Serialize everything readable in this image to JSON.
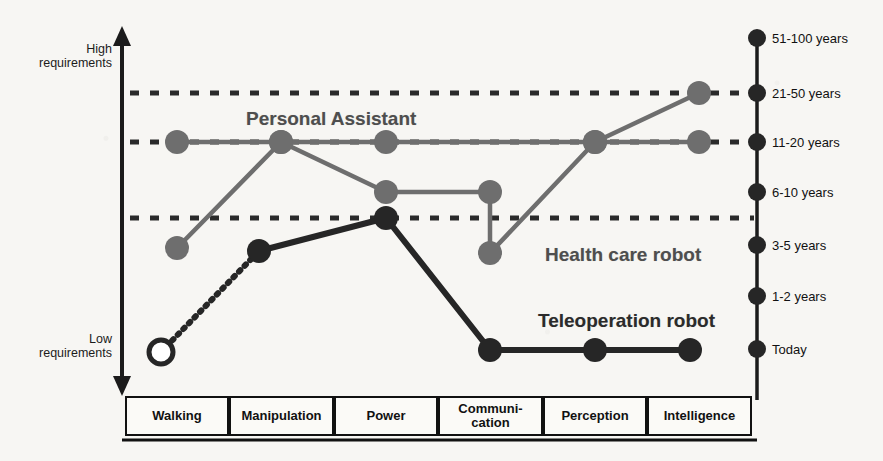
{
  "axis": {
    "left_top_label": "High\nrequirements",
    "left_bottom_label": "Low\nrequirements",
    "right_ticks": [
      {
        "label": "51-100 years",
        "y": 38
      },
      {
        "label": "21-50 years",
        "y": 93
      },
      {
        "label": "11-20 years",
        "y": 142
      },
      {
        "label": "6-10 years",
        "y": 192
      },
      {
        "label": "3-5 years",
        "y": 245
      },
      {
        "label": "1-2 years",
        "y": 296
      },
      {
        "label": "Today",
        "y": 349
      }
    ]
  },
  "categories": [
    {
      "label": "Walking",
      "x": 125,
      "w": 104
    },
    {
      "label": "Manipulation",
      "x": 229,
      "w": 105
    },
    {
      "label": "Power",
      "x": 334,
      "w": 104
    },
    {
      "label": "Communi-\ncation",
      "x": 438,
      "w": 105
    },
    {
      "label": "Perception",
      "x": 543,
      "w": 104
    },
    {
      "label": "Intelligence",
      "x": 647,
      "w": 105
    }
  ],
  "series_labels": {
    "personal_assistant": "Personal Assistant",
    "health_care_robot": "Health care robot",
    "teleoperation_robot": "Teleoperation robot"
  },
  "colors": {
    "ink": "#1b1b1b",
    "series_gray": "#6e6e6e",
    "series_dark": "#262626",
    "gridline": "#2a2a2a",
    "panel_bg": "#f7f6f3"
  },
  "gridlines": [
    93,
    142,
    218
  ],
  "chart_data": {
    "type": "line",
    "xlabel": "",
    "ylabel": "Requirements (low to high)",
    "categories": [
      "Walking",
      "Manipulation",
      "Power",
      "Communication",
      "Perception",
      "Intelligence"
    ],
    "y_axis_right_ticks": [
      "Today",
      "1-2 years",
      "3-5 years",
      "6-10 years",
      "11-20 years",
      "21-50 years",
      "51-100 years"
    ],
    "y_axis_left_range": [
      "Low requirements",
      "High requirements"
    ],
    "grid": true,
    "legend": "inline-annotations",
    "series": [
      {
        "name": "Personal Assistant",
        "color": "#6e6e6e",
        "marker": "filled-circle",
        "values": [
          "11-20 years",
          "11-20 years",
          "11-20 years",
          null,
          "11-20 years",
          "21-50 years"
        ],
        "points": [
          {
            "x": 177,
            "y": 142,
            "category": "Walking",
            "value": "11-20 years",
            "filled": true
          },
          {
            "x": 281,
            "y": 142,
            "category": "Manipulation",
            "value": "11-20 years",
            "filled": true
          },
          {
            "x": 386,
            "y": 142,
            "category": "Power",
            "value": "11-20 years",
            "filled": true
          },
          {
            "x": 595,
            "y": 142,
            "category": "Perception",
            "value": "11-20 years",
            "filled": true
          },
          {
            "x": 699,
            "y": 93,
            "category": "Intelligence",
            "value": "21-50 years",
            "filled": true
          }
        ]
      },
      {
        "name": "Health care robot",
        "color": "#6e6e6e",
        "marker": "filled-circle",
        "values": [
          "3-5 years",
          "11-20 years",
          "6-10 years",
          "3-5 years",
          "11-20 years",
          "11-20 years"
        ],
        "points": [
          {
            "x": 177,
            "y": 248,
            "category": "Walking",
            "value": "3-5 years",
            "filled": true
          },
          {
            "x": 281,
            "y": 142,
            "category": "Manipulation",
            "value": "11-20 years",
            "filled": true
          },
          {
            "x": 386,
            "y": 192,
            "category": "Power",
            "value": "6-10 years",
            "filled": true
          },
          {
            "x": 490,
            "y": 192,
            "category": "Communication",
            "value": "6-10 years",
            "filled": true
          },
          {
            "x": 490,
            "y": 253,
            "category": "Communication",
            "value": "3-5 years",
            "filled": true
          },
          {
            "x": 595,
            "y": 142,
            "category": "Perception",
            "value": "11-20 years",
            "filled": true
          },
          {
            "x": 699,
            "y": 142,
            "category": "Intelligence",
            "value": "11-20 years",
            "filled": true
          }
        ]
      },
      {
        "name": "Teleoperation robot",
        "color": "#262626",
        "marker": "filled-circle",
        "values": [
          "Today",
          "3-5 years",
          "6-10 years",
          "Today",
          "Today",
          "Today"
        ],
        "points": [
          {
            "x": 161,
            "y": 352,
            "category": "Walking",
            "value": "Today",
            "filled": false
          },
          {
            "x": 259,
            "y": 251,
            "category": "Manipulation",
            "value": "3-5 years",
            "filled": true
          },
          {
            "x": 386,
            "y": 218,
            "category": "Power",
            "value": "6-10 years",
            "filled": true
          },
          {
            "x": 490,
            "y": 350,
            "category": "Communication",
            "value": "Today",
            "filled": true
          },
          {
            "x": 595,
            "y": 350,
            "category": "Perception",
            "value": "Today",
            "filled": true
          },
          {
            "x": 690,
            "y": 350,
            "category": "Intelligence",
            "value": "Today",
            "filled": true
          }
        ]
      }
    ]
  }
}
